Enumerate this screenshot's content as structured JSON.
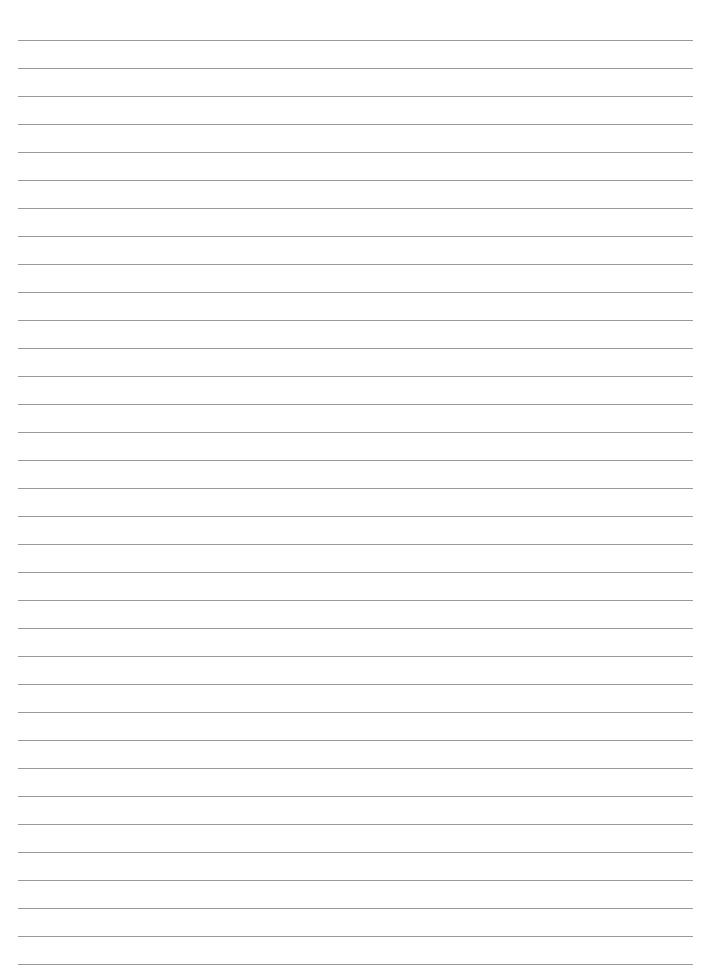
{
  "page": {
    "type": "lined-paper",
    "background_color": "#ffffff",
    "line_color": "#9a9a9a",
    "line_count": 34,
    "first_line_y": 40,
    "line_spacing": 28,
    "line_left": 18,
    "line_right": 693
  }
}
